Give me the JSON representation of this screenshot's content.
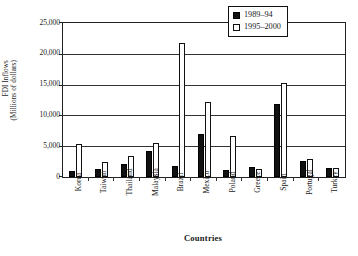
{
  "chart_data": {
    "type": "bar",
    "title": "",
    "xlabel": "Countries",
    "ylabel": "FDI Inflows (Millions of dollars)",
    "ylabel_lines": [
      "FDI Inflows",
      "(Millions of dollars)"
    ],
    "ylim": [
      0,
      25000
    ],
    "ytick_values": [
      0,
      5000,
      10000,
      15000,
      20000,
      25000
    ],
    "ytick_labels": [
      "0",
      "5,000",
      "10,000",
      "15,000",
      "20,000",
      "25,000"
    ],
    "grid": true,
    "legend_position": "top-right",
    "categories": [
      "Korea",
      "Taiwan",
      "Thailand",
      "Malaysia",
      "Brazil",
      "Mexico",
      "Poland",
      "Greece",
      "Spain",
      "Portugal",
      "Turkey"
    ],
    "series": [
      {
        "name": "1989–94",
        "color": "#111111",
        "values": [
          1000,
          1300,
          2100,
          4300,
          1800,
          7000,
          1200,
          1600,
          11900,
          2600,
          1400
        ]
      },
      {
        "name": "1995–2000",
        "color": "#ffffff",
        "values": [
          5400,
          2500,
          3400,
          5500,
          21800,
          12100,
          6600,
          1300,
          15200,
          3000,
          1500
        ]
      }
    ]
  },
  "legend": {
    "items": [
      {
        "label": "1989–94"
      },
      {
        "label": "1995–2000"
      }
    ]
  },
  "colors": {
    "series1": "#111111",
    "series2": "#ffffff",
    "axis": "#222222",
    "background": "#ffffff"
  }
}
